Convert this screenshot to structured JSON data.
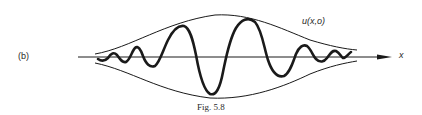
{
  "figure": {
    "panel_label": "(b)",
    "function_label": "u(x,o)",
    "axis_label": "x",
    "caption": "Fig. 5.8"
  },
  "diagram": {
    "type": "wave-packet",
    "colors": {
      "ink": "#1a1a1a",
      "background": "#ffffff"
    }
  }
}
